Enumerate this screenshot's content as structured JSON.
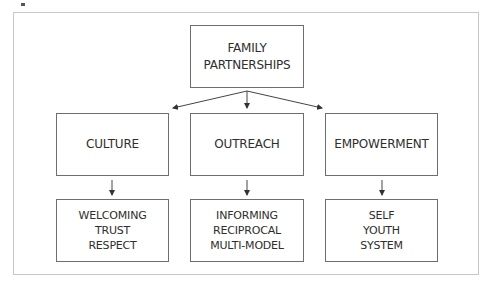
{
  "diagram": {
    "root": {
      "lines": [
        "FAMILY",
        "PARTNERSHIPS"
      ]
    },
    "categories": [
      {
        "label": "CULTURE",
        "items": [
          "WELCOMING",
          "TRUST",
          "RESPECT"
        ]
      },
      {
        "label": "OUTREACH",
        "items": [
          "INFORMING",
          "RECIPROCAL",
          "MULTI-MODEL"
        ]
      },
      {
        "label": "EMPOWERMENT",
        "items": [
          "SELF",
          "YOUTH",
          "SYSTEM"
        ]
      }
    ],
    "colors": {
      "border": "#6e6e6e",
      "frame": "#c8c8c8",
      "text": "#2e2e2e",
      "arrow": "#333333"
    }
  }
}
